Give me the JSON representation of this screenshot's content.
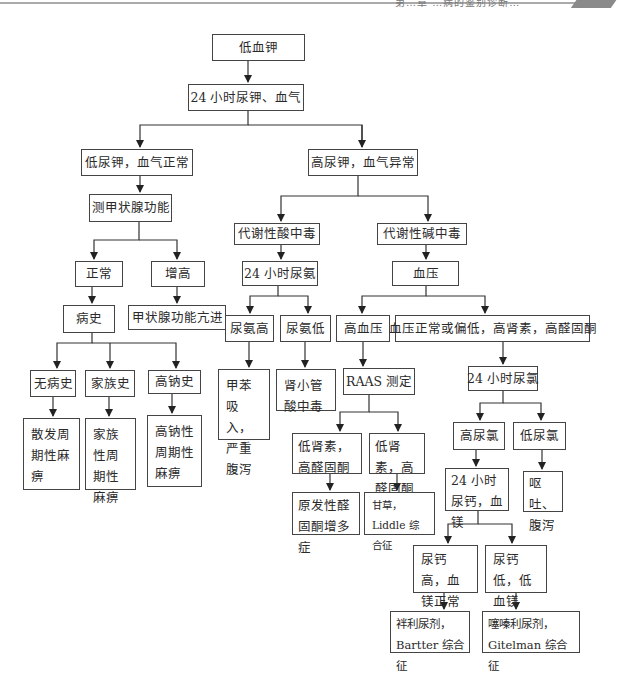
{
  "page_header": {
    "text": "第…章 …病的鉴别诊断…",
    "note": "running header, partially cut off"
  },
  "flowchart": {
    "root": "低血钾",
    "nodes": {
      "n1": "低血钾",
      "n2": "24 小时尿钾、血气",
      "n3": "低尿钾，血气正常",
      "n4": "高尿钾，血气异常",
      "n5": "测甲状腺功能",
      "n6": "正常",
      "n7": "增高",
      "n8": "病史",
      "n9": "甲状腺功能亢进",
      "n10": "无病史",
      "n11": "家族史",
      "n12": "高钠史",
      "n13": "散发周期性麻痹",
      "n14": "家族性周期性麻痹",
      "n15": "高钠性周期性麻痹",
      "n16": "代谢性酸中毒",
      "n17": "代谢性碱中毒",
      "n18": "24 小时尿氨",
      "n19": "血压",
      "n20": "尿氨高",
      "n21": "尿氨低",
      "n22": "甲苯吸入，严重腹泻",
      "n23": "肾小管酸中毒",
      "n24": "高血压",
      "n25": "血压正常或偏低，高肾素，高醛固酮",
      "n26": "RAAS 测定",
      "n27": "24 小时尿氯",
      "n28": "低肾素，高醛固酮",
      "n29": "低肾素，高醛固酮",
      "n30": "原发性醛固酮增多症",
      "n31": "甘草，Liddle 综合征",
      "n32": "高尿氯",
      "n33": "低尿氯",
      "n34": "24 小时尿钙，血镁",
      "n35": "呕吐、腹泻",
      "n36": "尿钙高，血镁正常",
      "n37": "尿钙低，低血镁",
      "n38": "袢利尿剂，Bartter 综合征",
      "n39": "噻嗪利尿剂，Gitelman 综合征"
    },
    "edges": [
      [
        "n1",
        "n2"
      ],
      [
        "n2",
        "n3"
      ],
      [
        "n2",
        "n4"
      ],
      [
        "n3",
        "n5"
      ],
      [
        "n5",
        "n6"
      ],
      [
        "n5",
        "n7"
      ],
      [
        "n6",
        "n8"
      ],
      [
        "n7",
        "n9"
      ],
      [
        "n8",
        "n10"
      ],
      [
        "n8",
        "n11"
      ],
      [
        "n8",
        "n12"
      ],
      [
        "n10",
        "n13"
      ],
      [
        "n11",
        "n14"
      ],
      [
        "n12",
        "n15"
      ],
      [
        "n4",
        "n16"
      ],
      [
        "n4",
        "n17"
      ],
      [
        "n16",
        "n18"
      ],
      [
        "n17",
        "n19"
      ],
      [
        "n18",
        "n20"
      ],
      [
        "n18",
        "n21"
      ],
      [
        "n20",
        "n22"
      ],
      [
        "n21",
        "n23"
      ],
      [
        "n19",
        "n24"
      ],
      [
        "n19",
        "n25"
      ],
      [
        "n24",
        "n26"
      ],
      [
        "n25",
        "n27"
      ],
      [
        "n26",
        "n28"
      ],
      [
        "n26",
        "n29"
      ],
      [
        "n28",
        "n30"
      ],
      [
        "n29",
        "n31"
      ],
      [
        "n27",
        "n32"
      ],
      [
        "n27",
        "n33"
      ],
      [
        "n32",
        "n34"
      ],
      [
        "n33",
        "n35"
      ],
      [
        "n34",
        "n36"
      ],
      [
        "n34",
        "n37"
      ],
      [
        "n36",
        "n38"
      ],
      [
        "n37",
        "n39"
      ]
    ]
  }
}
